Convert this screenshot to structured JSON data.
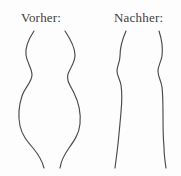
{
  "illustration": {
    "type": "before-after-body-silhouette-comparison",
    "language": "de",
    "background_color": "#fdfdfd",
    "line_color": "#4a4a4a",
    "text_color": "#3d3d3d"
  },
  "labels": {
    "before": "Vorher:",
    "after": "Nachher:"
  },
  "figures": [
    {
      "name": "before-figure",
      "label": "Vorher:",
      "description": "curvy silhouette with pronounced waist pinch and wide hips",
      "contours": [
        {
          "name": "before-left-contour",
          "path": "M 34 31 C 28 40 25 47 26 55 C 27 63 32 68 32 75 C 32 82 25 87 22 96 C 19 105 18 116 20 126 C 22 135 27 141 33 148 C 38 154 42 160 44 168"
        },
        {
          "name": "before-right-contour",
          "path": "M 65 31 C 71 40 75 47 75 55 C 75 63 70 68 68 74 C 66 80 70 85 74 93 C 79 103 81 114 80 124 C 79 134 74 141 69 148 C 64 155 61 161 60 168"
        }
      ]
    },
    {
      "name": "after-figure",
      "label": "Nachher:",
      "description": "slim near-straight silhouette with slight waist notch",
      "contours": [
        {
          "name": "after-left-contour",
          "path": "M 126 31 C 122 40 120 48 120 56 C 120 62 117 66 117 71 C 117 76 120 79 121 85 C 122 92 122 102 121 112 C 120 124 119 134 118 144 C 117 153 116 160 115 168"
        },
        {
          "name": "after-right-contour",
          "path": "M 159 31 C 162 40 163 48 162 56 C 161 62 158 66 158 71 C 158 77 161 80 162 87 C 163 96 163 106 163 116 C 163 127 163 137 164 147 C 164 155 165 161 166 168"
        }
      ]
    }
  ]
}
